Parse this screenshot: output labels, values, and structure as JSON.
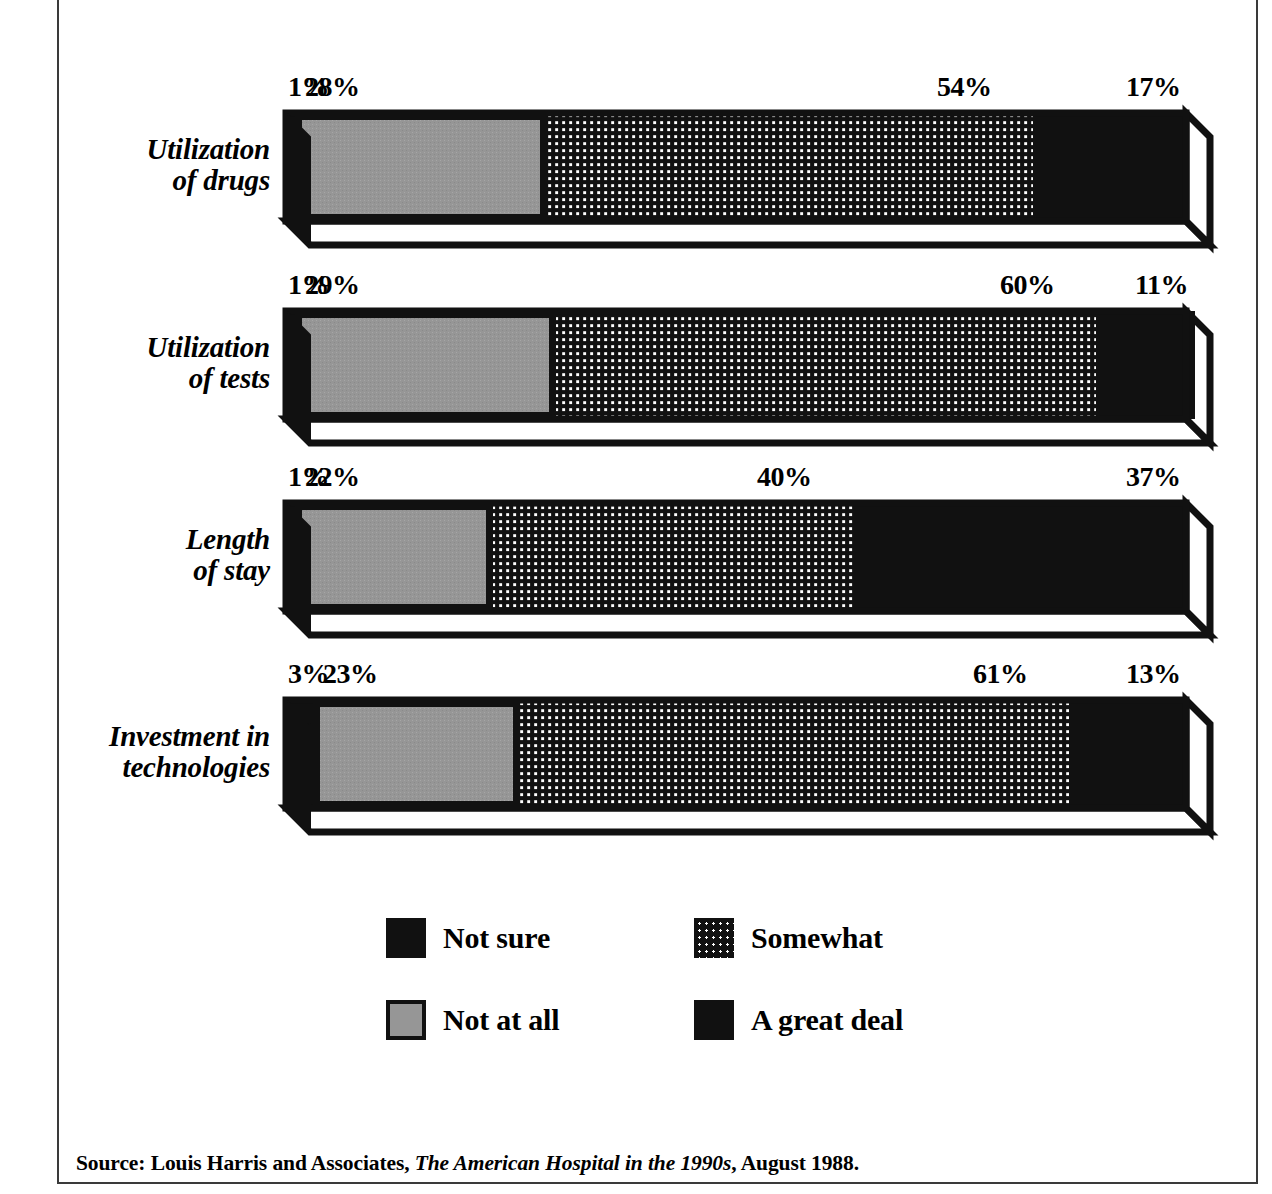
{
  "chart_data": {
    "type": "bar",
    "subtype": "3d-horizontal-stacked-bar",
    "title": "",
    "xlabel": "",
    "ylabel": "",
    "xlim": [
      0,
      100
    ],
    "grid": false,
    "stacked": true,
    "orientation": "horizontal",
    "units": "percent",
    "legend_position": "bottom-center",
    "categories": [
      "Utilization of drugs",
      "Utilization of tests",
      "Length of stay",
      "Investment in technologies"
    ],
    "series": [
      {
        "name": "Not sure",
        "fill": "solid-black",
        "color": "#111111",
        "values": [
          1,
          1,
          1,
          3
        ]
      },
      {
        "name": "Not at all",
        "fill": "solid-gray",
        "color": "#969696",
        "values": [
          28,
          29,
          22,
          23
        ]
      },
      {
        "name": "Somewhat",
        "fill": "dotted-grid",
        "color": "#141414",
        "values": [
          54,
          60,
          40,
          61
        ]
      },
      {
        "name": "A great deal",
        "fill": "solid-black",
        "color": "#111111",
        "values": [
          17,
          11,
          37,
          13
        ]
      }
    ],
    "data_labels": [
      {
        "category": "Utilization of drugs",
        "labels": [
          "1%",
          "28%",
          "54%",
          "17%"
        ]
      },
      {
        "category": "Utilization of tests",
        "labels": [
          "1%",
          "29%",
          "60%",
          "11%"
        ]
      },
      {
        "category": "Length of stay",
        "labels": [
          "1%",
          "22%",
          "40%",
          "37%"
        ]
      },
      {
        "category": "Investment in technologies",
        "labels": [
          "3%",
          "23%",
          "61%",
          "13%"
        ]
      }
    ]
  },
  "rows": [
    {
      "label": "Utilization\nof drugs",
      "segments": [
        {
          "series": "Not sure",
          "value": 1,
          "label": "1%"
        },
        {
          "series": "Not at all",
          "value": 28,
          "label": "28%"
        },
        {
          "series": "Somewhat",
          "value": 54,
          "label": "54%"
        },
        {
          "series": "A great deal",
          "value": 17,
          "label": "17%"
        }
      ]
    },
    {
      "label": "Utilization\nof tests",
      "segments": [
        {
          "series": "Not sure",
          "value": 1,
          "label": "1%"
        },
        {
          "series": "Not at all",
          "value": 29,
          "label": "29%"
        },
        {
          "series": "Somewhat",
          "value": 60,
          "label": "60%"
        },
        {
          "series": "A great deal",
          "value": 11,
          "label": "11%"
        }
      ]
    },
    {
      "label": "Length\nof stay",
      "segments": [
        {
          "series": "Not sure",
          "value": 1,
          "label": "1%"
        },
        {
          "series": "Not at all",
          "value": 22,
          "label": "22%"
        },
        {
          "series": "Somewhat",
          "value": 40,
          "label": "40%"
        },
        {
          "series": "A great deal",
          "value": 37,
          "label": "37%"
        }
      ]
    },
    {
      "label": "Investment in\ntechnologies",
      "segments": [
        {
          "series": "Not sure",
          "value": 3,
          "label": "3%"
        },
        {
          "series": "Not at all",
          "value": 23,
          "label": "23%"
        },
        {
          "series": "Somewhat",
          "value": 61,
          "label": "61%"
        },
        {
          "series": "A great deal",
          "value": 13,
          "label": "13%"
        }
      ]
    }
  ],
  "legend": {
    "items": [
      {
        "label": "Not sure",
        "swatch": "solid-black",
        "color": "#111111",
        "col": 0,
        "row": 0
      },
      {
        "label": "Somewhat",
        "swatch": "dotted-grid",
        "color": "#141414",
        "col": 1,
        "row": 0
      },
      {
        "label": "Not at all",
        "swatch": "solid-gray",
        "color": "#969696",
        "col": 0,
        "row": 1
      },
      {
        "label": "A great deal",
        "swatch": "solid-black",
        "color": "#111111",
        "col": 1,
        "row": 1
      }
    ]
  },
  "source": {
    "prefix": "Source: Louis Harris and Associates, ",
    "italic_title": "The American Hospital in the 1990s",
    "suffix": ", August 1988."
  },
  "colors": {
    "black": "#111111",
    "gray": "#969696",
    "white": "#ffffff",
    "frame": "#3a3a3a"
  }
}
